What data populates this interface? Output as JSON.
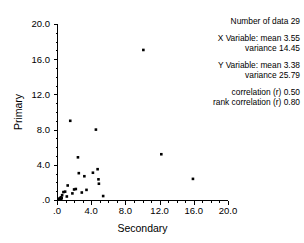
{
  "chart_data": {
    "type": "scatter",
    "title": "",
    "xlabel": "Secondary",
    "ylabel": "Primary",
    "xlim": [
      0,
      20
    ],
    "ylim": [
      0,
      20
    ],
    "xticks": [
      0,
      4,
      8,
      12,
      16,
      20
    ],
    "yticks": [
      0,
      4,
      8,
      12,
      16,
      20
    ],
    "xtick_labels": [
      ".0",
      "4.0",
      "8.0",
      "12.0",
      "16.0",
      "20.0"
    ],
    "ytick_labels": [
      ".0",
      "4.0",
      "8.0",
      "12.0",
      "16.0",
      "20.0"
    ],
    "minor_tick_interval": 1,
    "grid": false,
    "legend": false,
    "marker": "square",
    "marker_color": "#000000",
    "marker_size": 2.6,
    "points": [
      {
        "x": 0.25,
        "y": 0.1
      },
      {
        "x": 0.3,
        "y": 0.15
      },
      {
        "x": 0.35,
        "y": 0.2
      },
      {
        "x": 0.4,
        "y": 0.05
      },
      {
        "x": 0.45,
        "y": 0.3
      },
      {
        "x": 0.5,
        "y": 0.1
      },
      {
        "x": 0.55,
        "y": 0.25
      },
      {
        "x": 0.6,
        "y": 0.55
      },
      {
        "x": 0.75,
        "y": 0.9
      },
      {
        "x": 0.95,
        "y": 0.95
      },
      {
        "x": 1.15,
        "y": 0.4
      },
      {
        "x": 1.25,
        "y": 1.65
      },
      {
        "x": 1.55,
        "y": 9.0
      },
      {
        "x": 1.8,
        "y": 0.75
      },
      {
        "x": 2.0,
        "y": 1.2
      },
      {
        "x": 2.2,
        "y": 1.25
      },
      {
        "x": 2.45,
        "y": 4.85
      },
      {
        "x": 2.55,
        "y": 3.05
      },
      {
        "x": 2.9,
        "y": 0.85
      },
      {
        "x": 3.2,
        "y": 2.7
      },
      {
        "x": 3.45,
        "y": 1.15
      },
      {
        "x": 4.2,
        "y": 3.1
      },
      {
        "x": 4.55,
        "y": 8.0
      },
      {
        "x": 4.75,
        "y": 3.5
      },
      {
        "x": 4.85,
        "y": 2.35
      },
      {
        "x": 4.9,
        "y": 1.85
      },
      {
        "x": 5.4,
        "y": 0.45
      },
      {
        "x": 10.1,
        "y": 17.05
      },
      {
        "x": 12.2,
        "y": 5.2
      },
      {
        "x": 15.9,
        "y": 2.4
      }
    ]
  },
  "stats": {
    "count_label": "Number of data",
    "count_value": "29",
    "x_variable_label": "X Variable: mean",
    "x_mean": "3.55",
    "x_variance_label": "variance",
    "x_variance": "14.45",
    "y_variable_label": "Y Variable: mean",
    "y_mean": "3.38",
    "y_variance_label": "variance",
    "y_variance": "25.79",
    "correlation_label": "correlation (r)",
    "correlation_value": "0.50",
    "rank_correlation_label": "rank correlation (r)",
    "rank_correlation_value": "0.80"
  }
}
